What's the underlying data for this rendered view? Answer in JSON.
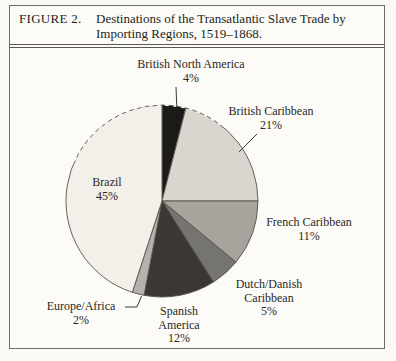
{
  "figure": {
    "label": "FIGURE 2.",
    "title_line1": "Destinations of the Transatlantic Slave Trade by",
    "title_line2": "Importing Regions, 1519–1868."
  },
  "chart_data": {
    "type": "pie",
    "title": "Destinations of the Transatlantic Slave Trade by Importing Regions, 1519–1868",
    "unit": "percent",
    "start_angle_deg": -90,
    "direction": "clockwise",
    "legend_position": "labels-around-pie",
    "segments": [
      {
        "label": "British North America",
        "value": 4,
        "pct_label": "4%",
        "color": "#1c1a18"
      },
      {
        "label": "British Caribbean",
        "value": 21,
        "pct_label": "21%",
        "color": "#d8d6cf"
      },
      {
        "label": "French Caribbean",
        "value": 11,
        "pct_label": "11%",
        "color": "#a7a49d"
      },
      {
        "label": "Dutch/Danish Caribbean",
        "value": 5,
        "pct_label": "5%",
        "color": "#767470"
      },
      {
        "label": "Spanish America",
        "value": 12,
        "pct_label": "12%",
        "color": "#3a3734"
      },
      {
        "label": "Europe/Africa",
        "value": 2,
        "pct_label": "2%",
        "color": "#b4b2ac"
      },
      {
        "label": "Brazil",
        "value": 45,
        "pct_label": "45%",
        "color": "#f2f0e9"
      }
    ]
  },
  "callouts": {
    "british_north_america": {
      "lines": [
        "British North America",
        "4%"
      ]
    },
    "british_caribbean": {
      "lines": [
        "British Caribbean",
        "21%"
      ]
    },
    "french_caribbean": {
      "lines": [
        "French Caribbean",
        "11%"
      ]
    },
    "dutch_danish_caribbean": {
      "lines": [
        "Dutch/Danish",
        "Caribbean",
        "5%"
      ]
    },
    "spanish_america": {
      "lines": [
        "Spanish",
        "America",
        "12%"
      ]
    },
    "europe_africa": {
      "lines": [
        "Europe/Africa",
        "2%"
      ]
    },
    "brazil": {
      "lines": [
        "Brazil",
        "45%"
      ]
    }
  }
}
